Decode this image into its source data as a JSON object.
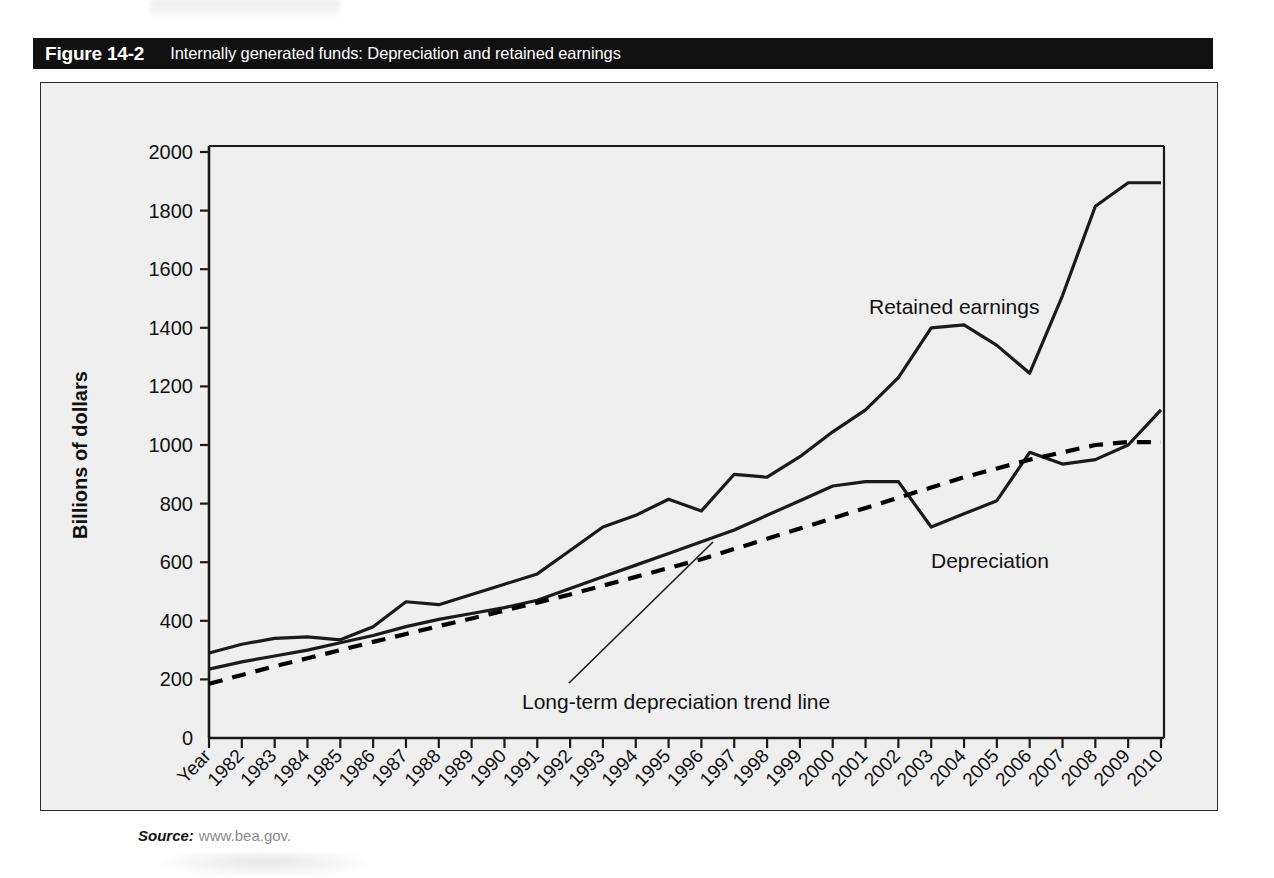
{
  "figure": {
    "number": "Figure 14-2",
    "title": "Internally generated funds: Depreciation and retained earnings"
  },
  "source": {
    "label": "Source:",
    "url": "www.bea.gov."
  },
  "colors": {
    "banner_background": "#111111",
    "banner_text": "#ffffff",
    "panel_background": "#efefef",
    "panel_border": "#2b2b2b",
    "series_line": "#1a1a1a",
    "trend_line": "#000000",
    "source_url_text": "#8a8a8a"
  },
  "chart_data": {
    "type": "line",
    "title": "Internally generated funds: Depreciation and retained earnings",
    "xlabel": "Year",
    "ylabel": "Billions of dollars",
    "ylim": [
      0,
      2000
    ],
    "yticks": [
      0,
      200,
      400,
      600,
      800,
      1000,
      1200,
      1400,
      1600,
      1800,
      2000
    ],
    "grid": false,
    "legend": "inline-annotations",
    "first_tick_label": "Year",
    "categories": [
      "Year",
      "1982",
      "1983",
      "1984",
      "1985",
      "1986",
      "1987",
      "1988",
      "1989",
      "1990",
      "1991",
      "1992",
      "1993",
      "1994",
      "1995",
      "1996",
      "1997",
      "1998",
      "1999",
      "2000",
      "2001",
      "2002",
      "2003",
      "2004",
      "2005",
      "2006",
      "2007",
      "2008",
      "2009",
      "2010"
    ],
    "x": [
      1981,
      1982,
      1983,
      1984,
      1985,
      1986,
      1987,
      1988,
      1989,
      1990,
      1991,
      1992,
      1993,
      1994,
      1995,
      1996,
      1997,
      1998,
      1999,
      2000,
      2001,
      2002,
      2003,
      2004,
      2005,
      2006,
      2007,
      2008,
      2009,
      2010
    ],
    "series": [
      {
        "name": "Retained earnings",
        "style": "solid",
        "values": [
          290,
          320,
          340,
          345,
          335,
          380,
          465,
          455,
          490,
          525,
          560,
          640,
          720,
          760,
          815,
          775,
          900,
          890,
          960,
          1045,
          1120,
          1230,
          1400,
          1410,
          1340,
          1245,
          1510,
          1815,
          1895,
          1895
        ]
      },
      {
        "name": "Depreciation",
        "style": "solid",
        "values": [
          235,
          260,
          280,
          300,
          325,
          350,
          380,
          405,
          425,
          445,
          470,
          510,
          550,
          590,
          630,
          670,
          710,
          760,
          810,
          860,
          875,
          875,
          720,
          765,
          810,
          975,
          935,
          950,
          1000,
          1120
        ]
      },
      {
        "name": "Long-term depreciation trend line",
        "style": "dashed",
        "values": [
          185,
          215,
          245,
          272,
          300,
          328,
          355,
          382,
          408,
          435,
          462,
          490,
          520,
          550,
          580,
          610,
          645,
          680,
          715,
          750,
          785,
          820,
          855,
          890,
          920,
          950,
          975,
          1000,
          1010,
          1010
        ]
      }
    ],
    "annotations": [
      {
        "text": "Retained earnings",
        "series": "Retained earnings"
      },
      {
        "text": "Depreciation",
        "series": "Depreciation"
      },
      {
        "text": "Long-term depreciation trend line",
        "series": "Long-term depreciation trend line",
        "has_leader_line": true
      }
    ]
  }
}
